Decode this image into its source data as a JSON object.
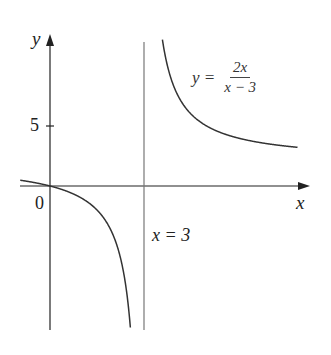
{
  "chart_data": {
    "type": "line",
    "title": "",
    "function": "y = 2x/(x - 3)",
    "xlabel": "x",
    "ylabel": "y",
    "origin_label": "0",
    "y_ticks": [
      {
        "value": 5,
        "label": "5"
      }
    ],
    "x_ticks": [],
    "asymptotes": [
      {
        "type": "vertical",
        "x": 3,
        "label": "x = 3"
      },
      {
        "type": "horizontal",
        "y": 2,
        "shown": false
      }
    ],
    "xlim": [
      -1,
      8
    ],
    "ylim": [
      -12,
      12.5
    ],
    "grid": false,
    "legend": null,
    "series": [
      {
        "name": "left branch",
        "x": [
          -0.95,
          -0.5,
          0,
          0.5,
          1,
          1.5,
          2,
          2.3,
          2.5,
          2.6,
          2.7
        ],
        "y": [
          0.48,
          0.29,
          0,
          -0.4,
          -1,
          -2,
          -4,
          -6.57,
          -10,
          -13,
          -18
        ]
      },
      {
        "name": "right branch",
        "x": [
          3.58,
          3.75,
          4,
          4.5,
          5,
          6,
          7,
          7.9
        ],
        "y": [
          12.34,
          10,
          8,
          6,
          5,
          4,
          3.5,
          3.22
        ]
      }
    ],
    "annotations": [
      {
        "text": "y = 2x/(x − 3)",
        "position": "upper right"
      },
      {
        "text": "x = 3",
        "position": "right of asymptote, below x-axis"
      }
    ]
  },
  "labels": {
    "y_axis": "y",
    "x_axis": "x",
    "origin": "0",
    "tick_5": "5",
    "asymptote": "x = 3",
    "eq_lhs": "y =",
    "eq_num": "2x",
    "eq_den": "x − 3"
  },
  "colors": {
    "axis": "#222222",
    "curve": "#333333",
    "asymptote": "#666666",
    "background": "#ffffff"
  }
}
